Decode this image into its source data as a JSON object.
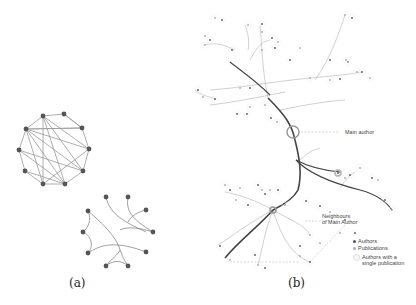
{
  "panels": {
    "a": {
      "caption": "(a)",
      "graph_top": {
        "nodes": [
          [
            43,
            116
          ],
          [
            64,
            114
          ],
          [
            82,
            128
          ],
          [
            89,
            149
          ],
          [
            83,
            171
          ],
          [
            65,
            184
          ],
          [
            43,
            184
          ],
          [
            25,
            171
          ],
          [
            19,
            150
          ],
          [
            26,
            129
          ]
        ],
        "edges": [
          [
            0,
            1
          ],
          [
            1,
            2
          ],
          [
            2,
            3
          ],
          [
            3,
            4
          ],
          [
            4,
            5
          ],
          [
            5,
            6
          ],
          [
            6,
            7
          ],
          [
            7,
            8
          ],
          [
            8,
            9
          ],
          [
            9,
            0
          ],
          [
            0,
            3
          ],
          [
            0,
            5
          ],
          [
            0,
            6
          ],
          [
            9,
            3
          ],
          [
            9,
            4
          ],
          [
            9,
            5
          ],
          [
            9,
            6
          ],
          [
            9,
            2
          ],
          [
            0,
            4
          ],
          [
            1,
            2
          ],
          [
            8,
            5
          ],
          [
            7,
            5
          ],
          [
            6,
            3
          ],
          [
            2,
            9
          ],
          [
            8,
            4
          ]
        ]
      },
      "graph_bottom": {
        "nodes": [
          [
            106,
            197
          ],
          [
            128,
            197
          ],
          [
            146,
            210
          ],
          [
            153,
            232
          ],
          [
            146,
            252
          ],
          [
            128,
            266
          ],
          [
            106,
            266
          ],
          [
            88,
            253
          ],
          [
            83,
            232
          ],
          [
            88,
            211
          ]
        ],
        "bundled_paths": [
          "M106,197 C110,215 125,222 146,232",
          "M128,197 C126,210 130,218 153,232",
          "M146,210 C138,212 132,215 128,222",
          "M88,211 C105,225 118,240 120,250",
          "M88,211 C92,220 88,228 83,232",
          "M83,232 C90,235 95,245 88,253",
          "M88,253 C100,245 115,240 146,252",
          "M120,250 C118,255 112,258 106,266",
          "M120,250 C122,255 124,260 128,266",
          "M106,266 C112,260 122,260 128,266",
          "M120,230 C128,226 140,228 153,232"
        ]
      }
    },
    "b": {
      "caption": "(b)",
      "annotations": {
        "main_author": "Main author",
        "neighbours_line1": "Neighbours",
        "neighbours_line2": "of Main Author"
      },
      "legend": {
        "authors": "Authors",
        "publications": "Publications",
        "single_line1": "Authors with a",
        "single_line2": "single publication"
      },
      "colors": {
        "author": "#555555",
        "publication": "#aaaaaa",
        "main_edge": "#444444",
        "light_edge": "#bbbbbb",
        "highlight": "#999999"
      },
      "main_paths": [
        "M268,98 C285,115 292,125 295,140 C300,160 302,175 298,190 C294,198 285,204 273,210",
        "M273,210 C260,225 240,240 225,258",
        "M296,160 C310,175 340,185 360,190 C375,194 385,200 392,210",
        "M296,160 C305,165 320,170 340,172",
        "M270,95 C255,80 240,70 230,62"
      ],
      "light_paths": [
        "M268,98 C262,70 262,45 260,25",
        "M250,60 C258,45 262,42 270,40",
        "M248,50 C250,40 247,30 245,25",
        "M210,90 C240,88 270,82 310,78 C330,76 345,75 362,72",
        "M210,105 C235,102 255,98 285,92",
        "M235,50 C225,45 215,42 205,45",
        "M195,90 C200,95 210,97 215,99",
        "M315,80 C330,60 340,30 345,15",
        "M280,110 C300,106 320,102 345,100",
        "M300,160 C310,150 315,150 320,148",
        "M273,210 C255,200 240,195 225,192",
        "M273,210 C265,230 262,250 258,265",
        "M273,210 C290,220 305,225 310,235",
        "M273,210 C285,250 300,258 310,262",
        "M273,210 C245,225 230,238 218,245",
        "M340,188 C345,180 350,175 355,172"
      ],
      "dashed_paths": [
        "M301,132 L340,132",
        "M305,221 L337,221",
        "M345,225 L310,262",
        "M230,262 L300,262"
      ],
      "highlight_circles": [
        [
          293,
          132,
          6
        ],
        [
          338,
          173,
          3
        ],
        [
          273,
          210,
          3
        ]
      ],
      "nodes": [
        [
          215,
          18
        ],
        [
          222,
          20
        ],
        [
          248,
          25
        ],
        [
          262,
          24
        ],
        [
          262,
          32
        ],
        [
          272,
          38
        ],
        [
          278,
          42
        ],
        [
          275,
          48
        ],
        [
          345,
          15
        ],
        [
          352,
          18
        ],
        [
          205,
          36
        ],
        [
          210,
          40
        ],
        [
          205,
          45
        ],
        [
          232,
          50
        ],
        [
          262,
          50
        ],
        [
          290,
          60
        ],
        [
          300,
          48
        ],
        [
          348,
          62
        ],
        [
          357,
          72
        ],
        [
          362,
          72
        ],
        [
          370,
          78
        ],
        [
          340,
          79
        ],
        [
          330,
          80
        ],
        [
          198,
          90
        ],
        [
          203,
          97
        ],
        [
          215,
          99
        ],
        [
          240,
          88
        ],
        [
          250,
          88
        ],
        [
          310,
          78
        ],
        [
          330,
          60
        ],
        [
          346,
          60
        ],
        [
          237,
          114
        ],
        [
          250,
          107
        ],
        [
          247,
          114
        ],
        [
          265,
          105
        ],
        [
          271,
          118
        ],
        [
          277,
          122
        ],
        [
          338,
          173
        ],
        [
          345,
          178
        ],
        [
          350,
          175
        ],
        [
          360,
          168
        ],
        [
          372,
          178
        ],
        [
          378,
          180
        ],
        [
          385,
          200
        ],
        [
          392,
          210
        ],
        [
          320,
          206
        ],
        [
          330,
          212
        ],
        [
          345,
          220
        ],
        [
          340,
          233
        ],
        [
          355,
          233
        ],
        [
          225,
          185
        ],
        [
          230,
          190
        ],
        [
          240,
          188
        ],
        [
          258,
          185
        ],
        [
          262,
          190
        ],
        [
          265,
          194
        ],
        [
          270,
          190
        ],
        [
          278,
          190
        ],
        [
          236,
          200
        ],
        [
          248,
          205
        ],
        [
          285,
          205
        ],
        [
          306,
          201
        ],
        [
          310,
          235
        ],
        [
          300,
          246
        ],
        [
          320,
          243
        ],
        [
          220,
          246
        ],
        [
          230,
          260
        ],
        [
          255,
          255
        ],
        [
          258,
          265
        ],
        [
          265,
          268
        ],
        [
          300,
          256
        ],
        [
          310,
          262
        ]
      ]
    }
  }
}
